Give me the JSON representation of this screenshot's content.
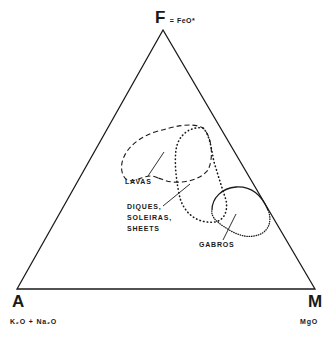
{
  "diagram": {
    "type": "ternary-AFM",
    "vertices": {
      "top": {
        "letter": "F",
        "formula": "= FeO*"
      },
      "left": {
        "letter": "A",
        "formula": "K₂O + Na₂O"
      },
      "right": {
        "letter": "M",
        "formula": "MgO"
      }
    },
    "fields": [
      {
        "label": "LAVAS",
        "line_style": "dashed"
      },
      {
        "label_lines": [
          "DIQUES,",
          "SOLEIRAS,",
          "SHEETS"
        ],
        "line_style": "dotted"
      },
      {
        "label": "GABROS",
        "line_style": "solid-and-dotted"
      }
    ],
    "colors": {
      "ink": "#1a1a1a",
      "background": "#ffffff"
    }
  }
}
